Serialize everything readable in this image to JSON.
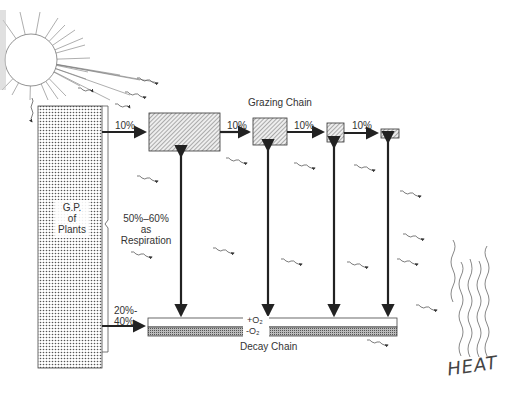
{
  "diagram": {
    "title": "Grazing Chain",
    "source": {
      "name": "Sun",
      "icon": "sun-icon"
    },
    "producer": {
      "label_lines": [
        "G.P.",
        "of",
        "Plants"
      ]
    },
    "grazing_chain": {
      "label": "Grazing Chain",
      "transfers": [
        "10%",
        "10%",
        "10%",
        "10%"
      ],
      "trophic_boxes": 4
    },
    "respiration": {
      "label_lines": [
        "50%–60%",
        "as",
        "Respiration"
      ]
    },
    "decay_transfer": {
      "label_lines": [
        "20%-",
        "40%"
      ]
    },
    "decay_chain": {
      "label": "Decay Chain",
      "aerobic": "+O₂",
      "anaerobic": "-O₂"
    },
    "heat": {
      "label": "HEAT"
    }
  }
}
